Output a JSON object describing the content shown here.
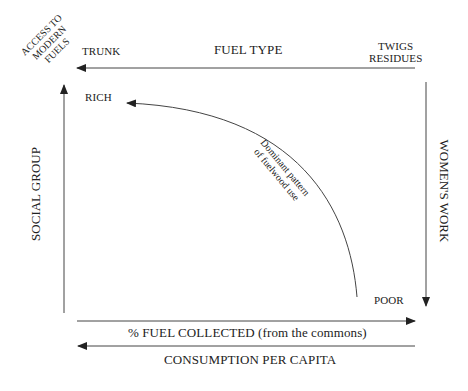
{
  "diagram": {
    "corner_label": [
      "ACCESS TO",
      "MODERN",
      "FUELS"
    ],
    "top_axis": {
      "title": "FUEL TYPE",
      "left_end": "TRUNK",
      "right_end": [
        "TWIGS",
        "RESIDUES"
      ],
      "direction": "right-to-left"
    },
    "left_axis": {
      "title": "SOCIAL GROUP",
      "direction": "bottom-to-top"
    },
    "right_axis": {
      "title": "WOMEN'S WORK",
      "direction": "top-to-bottom"
    },
    "bottom_axes": [
      {
        "title": "% FUEL COLLECTED (from the commons)",
        "direction": "left-to-right"
      },
      {
        "title": "CONSUMPTION PER CAPITA",
        "direction": "right-to-left"
      }
    ],
    "points": {
      "rich": "RICH",
      "poor": "POOR"
    },
    "curve_label": [
      "Dominant pattern",
      "of fuelwood use"
    ],
    "colors": {
      "line": "#333333",
      "text": "#222222",
      "background": "#ffffff"
    }
  }
}
